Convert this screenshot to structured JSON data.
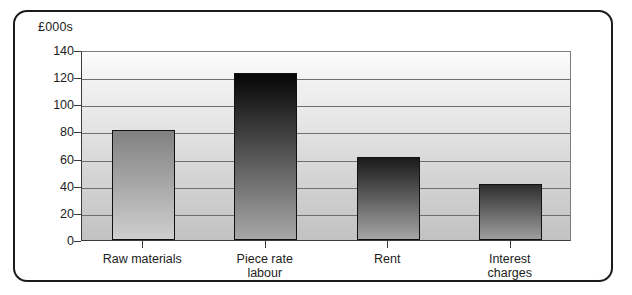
{
  "chart_data": {
    "type": "bar",
    "title": "",
    "subtitle": "",
    "unit_label": "£000s",
    "xlabel": "",
    "ylabel": "",
    "categories": [
      "Raw materials",
      "Piece rate\nlabour",
      "Rent",
      "Interest\ncharges"
    ],
    "values": [
      81,
      123,
      61,
      41
    ],
    "ylim": [
      0,
      140
    ],
    "ytick_labels": [
      "0",
      "20",
      "40",
      "60",
      "80",
      "100",
      "120",
      "140"
    ],
    "ytick_values": [
      0,
      20,
      40,
      60,
      80,
      100,
      120,
      140
    ],
    "grid": "horizontal",
    "legend": "none",
    "bar_colors": [
      "#8d8d8d",
      "#111111",
      "#2b2b2b",
      "#333333"
    ],
    "bar_outline_color": "#111111",
    "plot_background": "#dcdcdc",
    "frame_color": "#1b1b1b"
  },
  "series_detail": [
    {
      "category": "Raw materials",
      "value": 81,
      "gradient_top": "#818181",
      "gradient_bottom": "#cfcfcf"
    },
    {
      "category": "Piece rate labour",
      "value": 123,
      "gradient_top": "#050505",
      "gradient_bottom": "#a8a8a8"
    },
    {
      "category": "Rent",
      "value": 61,
      "gradient_top": "#1a1a1a",
      "gradient_bottom": "#a5a5a5"
    },
    {
      "category": "Interest charges",
      "value": 41,
      "gradient_top": "#2e2e2e",
      "gradient_bottom": "#9e9e9e"
    }
  ]
}
